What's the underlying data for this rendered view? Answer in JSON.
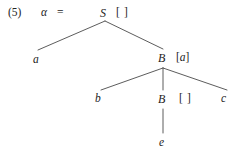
{
  "figure": {
    "example_number": "(5)",
    "alpha_symbol": "α",
    "equals_symbol": "=",
    "background_color": "#ffffff",
    "line_color": "#4a4a4a",
    "text_color": "#232323"
  },
  "tree": {
    "root": {
      "category": "S",
      "brackets": "[ ]"
    },
    "level2": {
      "left_leaf": "a",
      "right_node_category": "B",
      "right_node_brackets_open": "[",
      "right_node_brackets_content": "a",
      "right_node_brackets_close": "]"
    },
    "level3": {
      "left_leaf": "b",
      "middle_node_category": "B",
      "middle_node_brackets": "[ ]",
      "right_leaf": "c"
    },
    "level4": {
      "leaf": "e"
    }
  },
  "edges": [
    {
      "name": "s-to-a",
      "x1": 105,
      "y1": 21,
      "x2": 38,
      "y2": 50
    },
    {
      "name": "s-to-b1",
      "x1": 105,
      "y1": 21,
      "x2": 163,
      "y2": 49
    },
    {
      "name": "b1-to-b",
      "x1": 163,
      "y1": 68,
      "x2": 101,
      "y2": 90
    },
    {
      "name": "b1-to-b2",
      "x1": 163,
      "y1": 68,
      "x2": 163,
      "y2": 90
    },
    {
      "name": "b1-to-c",
      "x1": 163,
      "y1": 68,
      "x2": 227,
      "y2": 90
    },
    {
      "name": "b2-to-e",
      "x1": 163,
      "y1": 109,
      "x2": 163,
      "y2": 133
    }
  ]
}
